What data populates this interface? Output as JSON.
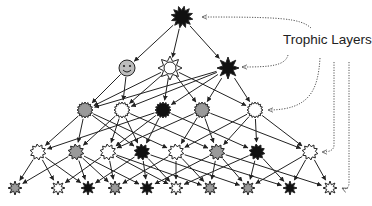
{
  "diagram": {
    "title_label": "Trophic Layers",
    "colors": {
      "black": "#111111",
      "gray": "#9a9a9a",
      "white": "#ffffff",
      "edge": "#222222",
      "pointer": "#555555"
    },
    "nodes": [
      {
        "id": "n0",
        "layer": 0,
        "x": 182,
        "y": 17,
        "fill": "black",
        "shape": "burst",
        "r": 11
      },
      {
        "id": "n1a",
        "layer": 1,
        "x": 127,
        "y": 68,
        "fill": "gray",
        "shape": "smiley",
        "r": 8
      },
      {
        "id": "n1b",
        "layer": 1,
        "x": 170,
        "y": 68,
        "fill": "white",
        "shape": "sun",
        "r": 9
      },
      {
        "id": "n1c",
        "layer": 1,
        "x": 228,
        "y": 68,
        "fill": "black",
        "shape": "star",
        "r": 11
      },
      {
        "id": "n2a",
        "layer": 2,
        "x": 85,
        "y": 110,
        "fill": "gray",
        "shape": "gear",
        "r": 8
      },
      {
        "id": "n2b",
        "layer": 2,
        "x": 122,
        "y": 110,
        "fill": "white",
        "shape": "gear",
        "r": 8
      },
      {
        "id": "n2c",
        "layer": 2,
        "x": 163,
        "y": 110,
        "fill": "black",
        "shape": "gear",
        "r": 8
      },
      {
        "id": "n2d",
        "layer": 2,
        "x": 202,
        "y": 110,
        "fill": "gray",
        "shape": "gear",
        "r": 8
      },
      {
        "id": "n2e",
        "layer": 2,
        "x": 255,
        "y": 110,
        "fill": "white",
        "shape": "gear",
        "r": 8
      },
      {
        "id": "n3a",
        "layer": 3,
        "x": 38,
        "y": 152,
        "fill": "white",
        "shape": "burst",
        "r": 8
      },
      {
        "id": "n3b",
        "layer": 3,
        "x": 76,
        "y": 152,
        "fill": "gray",
        "shape": "burst",
        "r": 8
      },
      {
        "id": "n3c",
        "layer": 3,
        "x": 108,
        "y": 152,
        "fill": "white",
        "shape": "burst",
        "r": 8
      },
      {
        "id": "n3d",
        "layer": 3,
        "x": 142,
        "y": 152,
        "fill": "black",
        "shape": "burst",
        "r": 8
      },
      {
        "id": "n3e",
        "layer": 3,
        "x": 176,
        "y": 152,
        "fill": "white",
        "shape": "burst",
        "r": 8
      },
      {
        "id": "n3f",
        "layer": 3,
        "x": 217,
        "y": 152,
        "fill": "gray",
        "shape": "burst",
        "r": 8
      },
      {
        "id": "n3g",
        "layer": 3,
        "x": 257,
        "y": 152,
        "fill": "black",
        "shape": "burst",
        "r": 8
      },
      {
        "id": "n3h",
        "layer": 3,
        "x": 310,
        "y": 152,
        "fill": "white",
        "shape": "burst",
        "r": 8
      },
      {
        "id": "n4a",
        "layer": 4,
        "x": 15,
        "y": 188,
        "fill": "gray",
        "shape": "star",
        "r": 7
      },
      {
        "id": "n4b",
        "layer": 4,
        "x": 58,
        "y": 188,
        "fill": "white",
        "shape": "star",
        "r": 7
      },
      {
        "id": "n4c",
        "layer": 4,
        "x": 88,
        "y": 188,
        "fill": "black",
        "shape": "star",
        "r": 7
      },
      {
        "id": "n4d",
        "layer": 4,
        "x": 115,
        "y": 188,
        "fill": "gray",
        "shape": "star",
        "r": 7
      },
      {
        "id": "n4e",
        "layer": 4,
        "x": 147,
        "y": 188,
        "fill": "black",
        "shape": "star",
        "r": 7
      },
      {
        "id": "n4f",
        "layer": 4,
        "x": 176,
        "y": 188,
        "fill": "white",
        "shape": "star",
        "r": 7
      },
      {
        "id": "n4g",
        "layer": 4,
        "x": 210,
        "y": 188,
        "fill": "gray",
        "shape": "star",
        "r": 7
      },
      {
        "id": "n4h",
        "layer": 4,
        "x": 248,
        "y": 188,
        "fill": "gray",
        "shape": "star",
        "r": 7
      },
      {
        "id": "n4i",
        "layer": 4,
        "x": 290,
        "y": 188,
        "fill": "black",
        "shape": "star",
        "r": 7
      },
      {
        "id": "n4j",
        "layer": 4,
        "x": 330,
        "y": 188,
        "fill": "white",
        "shape": "star",
        "r": 7
      }
    ],
    "edges": [
      [
        "n0",
        "n1a"
      ],
      [
        "n0",
        "n1b"
      ],
      [
        "n0",
        "n1c"
      ],
      [
        "n1a",
        "n2a"
      ],
      [
        "n1a",
        "n2b"
      ],
      [
        "n1b",
        "n2a"
      ],
      [
        "n1b",
        "n2b"
      ],
      [
        "n1b",
        "n2c"
      ],
      [
        "n1b",
        "n2d"
      ],
      [
        "n1b",
        "n2e"
      ],
      [
        "n1c",
        "n2a"
      ],
      [
        "n1c",
        "n2b"
      ],
      [
        "n1c",
        "n2c"
      ],
      [
        "n1c",
        "n2d"
      ],
      [
        "n1c",
        "n2e"
      ],
      [
        "n2a",
        "n3a"
      ],
      [
        "n2a",
        "n3b"
      ],
      [
        "n2a",
        "n3d"
      ],
      [
        "n2a",
        "n3e"
      ],
      [
        "n2b",
        "n3b"
      ],
      [
        "n2b",
        "n3c"
      ],
      [
        "n2b",
        "n3d"
      ],
      [
        "n2b",
        "n3f"
      ],
      [
        "n2c",
        "n3a"
      ],
      [
        "n2c",
        "n3c"
      ],
      [
        "n2c",
        "n3d"
      ],
      [
        "n2c",
        "n3g"
      ],
      [
        "n2d",
        "n3c"
      ],
      [
        "n2d",
        "n3e"
      ],
      [
        "n2d",
        "n3f"
      ],
      [
        "n2d",
        "n3h"
      ],
      [
        "n2e",
        "n3e"
      ],
      [
        "n2e",
        "n3f"
      ],
      [
        "n2e",
        "n3g"
      ],
      [
        "n2e",
        "n3h"
      ],
      [
        "n3a",
        "n4a"
      ],
      [
        "n3a",
        "n4b"
      ],
      [
        "n3a",
        "n4c"
      ],
      [
        "n3b",
        "n4a"
      ],
      [
        "n3b",
        "n4c"
      ],
      [
        "n3b",
        "n4d"
      ],
      [
        "n3b",
        "n4e"
      ],
      [
        "n3c",
        "n4b"
      ],
      [
        "n3c",
        "n4d"
      ],
      [
        "n3c",
        "n4f"
      ],
      [
        "n3c",
        "n4g"
      ],
      [
        "n3d",
        "n4c"
      ],
      [
        "n3d",
        "n4e"
      ],
      [
        "n3d",
        "n4f"
      ],
      [
        "n3d",
        "n4h"
      ],
      [
        "n3e",
        "n4d"
      ],
      [
        "n3e",
        "n4f"
      ],
      [
        "n3e",
        "n4g"
      ],
      [
        "n3e",
        "n4i"
      ],
      [
        "n3f",
        "n4e"
      ],
      [
        "n3f",
        "n4g"
      ],
      [
        "n3f",
        "n4h"
      ],
      [
        "n3f",
        "n4j"
      ],
      [
        "n3g",
        "n4f"
      ],
      [
        "n3g",
        "n4h"
      ],
      [
        "n3g",
        "n4i"
      ],
      [
        "n3h",
        "n4h"
      ],
      [
        "n3h",
        "n4i"
      ],
      [
        "n3h",
        "n4j"
      ]
    ],
    "pointers": [
      {
        "to": "n0",
        "path": "M311 28 C300 18, 280 17, 202 17"
      },
      {
        "to": "n1c",
        "path": "M288 55 C285 66, 270 67, 242 67"
      },
      {
        "to": "n2e",
        "path": "M320 58 C318 90, 310 110, 268 110"
      },
      {
        "to": "n3h",
        "path": "M334 62 L334 145 C334 150, 330 152, 322 152"
      },
      {
        "to": "n4j",
        "path": "M349 62 L349 183 C349 188, 346 190, 342 188"
      }
    ]
  }
}
